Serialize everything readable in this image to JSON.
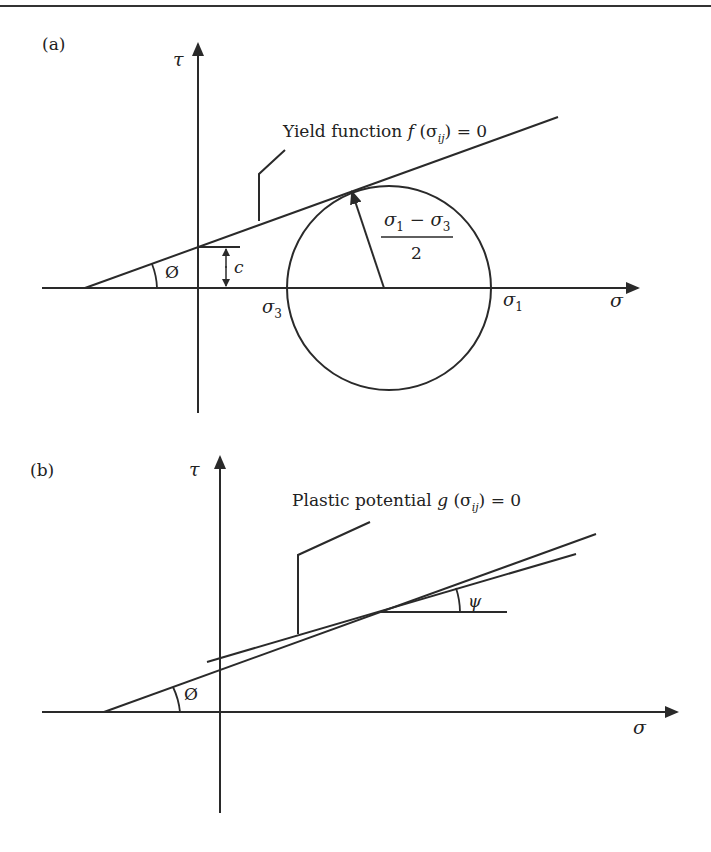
{
  "figure": {
    "panel_a": {
      "label": "(a)",
      "y_axis_label": "τ",
      "x_axis_label": "σ",
      "yield_label_prefix": "Yield function ",
      "yield_label_func": "f",
      "yield_label_open": " (σ",
      "yield_label_sub": "ij",
      "yield_label_close": ") = 0",
      "friction_angle_symbol": "Ø",
      "cohesion_symbol": "c",
      "sigma3_label": "σ",
      "sigma3_sub": "3",
      "sigma1_label": "σ",
      "sigma1_sub": "1",
      "radius_numerator_a": "σ",
      "radius_numerator_a_sub": "1",
      "radius_minus": " − ",
      "radius_numerator_b": "σ",
      "radius_numerator_b_sub": "3",
      "radius_denominator": "2"
    },
    "panel_b": {
      "label": "(b)",
      "y_axis_label": "τ",
      "x_axis_label": "σ",
      "potential_label_prefix": "Plastic potential ",
      "potential_label_func": "g",
      "potential_label_open": " (σ",
      "potential_label_sub": "ij",
      "potential_label_close": ") = 0",
      "friction_angle_symbol": "Ø",
      "dilation_angle_symbol": "ψ"
    },
    "colors": {
      "line": "#2a2a2a",
      "background": "#ffffff"
    }
  }
}
